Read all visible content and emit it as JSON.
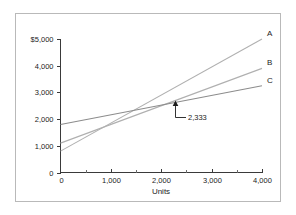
{
  "chart_data": {
    "type": "line",
    "title": "",
    "xlabel": "Units",
    "ylabel": "",
    "xlim": [
      0,
      4000
    ],
    "ylim": [
      0,
      5000
    ],
    "grid": false,
    "legend_position": "line-end-labels",
    "x_ticks": [
      0,
      1000,
      2000,
      3000,
      4000
    ],
    "x_tick_labels": [
      "0",
      "1,000",
      "2,000",
      "3,000",
      "4,000"
    ],
    "x_minor_ticks": [
      500,
      1500,
      2500,
      3500
    ],
    "y_ticks": [
      0,
      1000,
      2000,
      3000,
      4000,
      5000
    ],
    "y_tick_labels": [
      "0",
      "1,000",
      "2,000",
      "3,000",
      "4,000",
      "$5,000"
    ],
    "x": [
      0,
      4000
    ],
    "series": [
      {
        "name": "A",
        "label": "A",
        "values": [
          800,
          5000
        ],
        "color": "#b0b0b0"
      },
      {
        "name": "B",
        "label": "B",
        "values": [
          1100,
          3900
        ],
        "color": "#b0b0b0"
      },
      {
        "name": "C",
        "label": "C",
        "values": [
          1800,
          3250
        ],
        "color": "#8c8c8c"
      }
    ],
    "annotations": [
      {
        "text": "2,333",
        "x": 2333,
        "y": 2650,
        "points_to": "intersection-of-b-and-c"
      }
    ]
  },
  "axes": {
    "x_axis_name": "units-axis",
    "y_axis_name": "dollars-axis"
  }
}
